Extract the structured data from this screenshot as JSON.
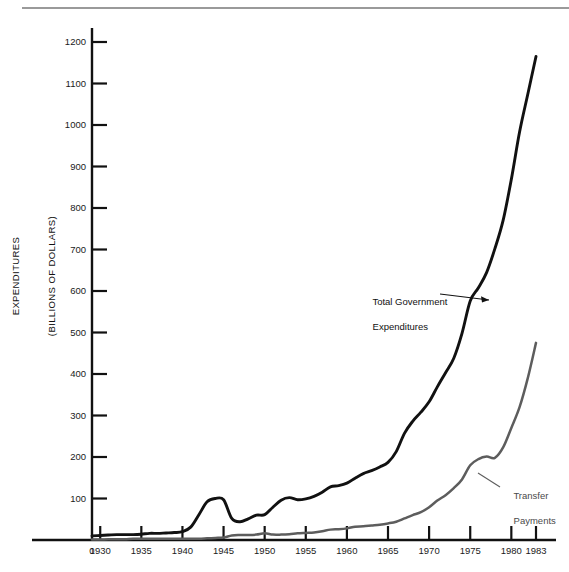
{
  "figure": {
    "name": "government-expenditures-chart",
    "top_rule": true
  },
  "axes": {
    "y_title_line1": "EXPENDITURES",
    "y_title_line2": "(BILLIONS OF DOLLARS)",
    "y_ticks": [
      0,
      100,
      200,
      300,
      400,
      500,
      600,
      700,
      800,
      900,
      1000,
      1100,
      1200
    ],
    "x_ticks": [
      1930,
      1935,
      1940,
      1945,
      1950,
      1955,
      1960,
      1965,
      1970,
      1975,
      1980,
      1983
    ],
    "x_tick_labels": [
      "1930",
      "1935",
      "1940",
      "1945",
      "1950",
      "1955",
      "1960",
      "1965",
      "1970",
      "1975",
      "1980",
      "1983"
    ],
    "origin_label": "0"
  },
  "annotations": {
    "total_line1": "Total Government",
    "total_line2": "Expenditures",
    "transfer_line1": "Transfer",
    "transfer_line2": "Payments"
  },
  "colors": {
    "total": "#111111",
    "transfer": "#5d5d5d",
    "axis": "#111111",
    "rule": "#9a9a9a",
    "background": "#ffffff"
  },
  "chart_data": {
    "type": "line",
    "title": "",
    "xlabel": "",
    "ylabel": "EXPENDITURES (BILLIONS OF DOLLARS)",
    "xlim": [
      1929,
      1983
    ],
    "ylim": [
      0,
      1250
    ],
    "yticks": [
      0,
      100,
      200,
      300,
      400,
      500,
      600,
      700,
      800,
      900,
      1000,
      1100,
      1200
    ],
    "xticks": [
      1930,
      1935,
      1940,
      1945,
      1950,
      1955,
      1960,
      1965,
      1970,
      1975,
      1980,
      1983
    ],
    "grid": false,
    "legend": "inline-annotations",
    "x": [
      1929,
      1930,
      1931,
      1932,
      1933,
      1934,
      1935,
      1936,
      1937,
      1938,
      1939,
      1940,
      1941,
      1942,
      1943,
      1944,
      1945,
      1946,
      1947,
      1948,
      1949,
      1950,
      1951,
      1952,
      1953,
      1954,
      1955,
      1956,
      1957,
      1958,
      1959,
      1960,
      1961,
      1962,
      1963,
      1964,
      1965,
      1966,
      1967,
      1968,
      1969,
      1970,
      1971,
      1972,
      1973,
      1974,
      1975,
      1976,
      1977,
      1978,
      1979,
      1980,
      1981,
      1982,
      1983
    ],
    "series": [
      {
        "name": "Total Government Expenditures",
        "color": "#111111",
        "values": [
          10,
          11,
          12,
          13,
          13,
          13,
          14,
          16,
          16,
          17,
          18,
          20,
          31,
          61,
          92,
          100,
          97,
          52,
          44,
          51,
          60,
          61,
          79,
          96,
          102,
          97,
          99,
          105,
          115,
          128,
          131,
          137,
          149,
          160,
          167,
          176,
          187,
          213,
          257,
          286,
          308,
          333,
          369,
          403,
          438,
          498,
          576,
          608,
          645,
          702,
          770,
          869,
          983,
          1074,
          1165
        ]
      },
      {
        "name": "Transfer Payments",
        "color": "#5d5d5d",
        "values": [
          1,
          1,
          2,
          2,
          2,
          3,
          3,
          3,
          3,
          3,
          3,
          3,
          3,
          3,
          4,
          5,
          6,
          11,
          12,
          12,
          13,
          16,
          13,
          13,
          14,
          16,
          17,
          18,
          21,
          25,
          26,
          28,
          32,
          33,
          35,
          37,
          40,
          44,
          52,
          60,
          67,
          79,
          95,
          108,
          125,
          146,
          180,
          195,
          201,
          198,
          223,
          270,
          320,
          390,
          475
        ]
      }
    ]
  }
}
